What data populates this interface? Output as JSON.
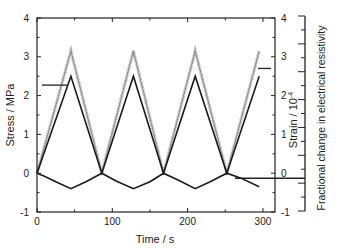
{
  "chart_data": {
    "type": "line",
    "title": "",
    "xlabel": "Time / s",
    "ylabel_left": "Stress / MPa",
    "ylabel_right": "Strain / 10^-4",
    "ylabel_right_sup": "-4",
    "ylabel_right_base": "Strain / 10",
    "ylabel_far_right": "Fractional change in electrical resistivity",
    "xlim": [
      0,
      316
    ],
    "ylim": [
      -1,
      4
    ],
    "x_ticks": [
      0,
      100,
      200,
      300
    ],
    "y_ticks_left": [
      -1,
      0,
      1,
      2,
      3,
      4
    ],
    "y_ticks_right": [
      -1,
      0,
      1,
      2,
      3,
      4
    ],
    "grid": false,
    "legend": "none (arrows indicate axis association)",
    "series": [
      {
        "name": "Stress",
        "axis": "left",
        "color": "#8a8a8a",
        "marker": "small crosses",
        "x": [
          0,
          45,
          86,
          128,
          168,
          210,
          252,
          295
        ],
        "values": [
          0,
          3.15,
          0,
          3.15,
          0,
          3.15,
          0,
          3.15
        ]
      },
      {
        "name": "Strain",
        "axis": "right",
        "color": "#1a1a1a",
        "x": [
          0,
          45,
          86,
          128,
          168,
          210,
          252,
          295
        ],
        "values": [
          0,
          2.5,
          0,
          2.5,
          0,
          2.5,
          0,
          2.5
        ]
      },
      {
        "name": "Fractional change in electrical resistivity",
        "axis": "far_right",
        "color": "#1a1a1a",
        "x": [
          0,
          10,
          25,
          45,
          65,
          86,
          105,
          128,
          150,
          168,
          190,
          210,
          230,
          252,
          270,
          295
        ],
        "values": [
          0,
          -0.08,
          -0.22,
          -0.4,
          -0.22,
          0,
          -0.2,
          -0.4,
          -0.22,
          0,
          -0.2,
          -0.4,
          -0.22,
          0,
          -0.12,
          -0.35
        ]
      }
    ],
    "annotations": [
      {
        "type": "arrow-line",
        "points_to": "Stress",
        "side": "left",
        "y_value": 2.27
      },
      {
        "type": "arrow-line",
        "points_to": "Strain",
        "side": "right",
        "y_value": 2.7
      },
      {
        "type": "arrow-line",
        "points_to": "Fractional change in electrical resistivity",
        "side": "far_right",
        "y_value": -0.13
      }
    ]
  }
}
